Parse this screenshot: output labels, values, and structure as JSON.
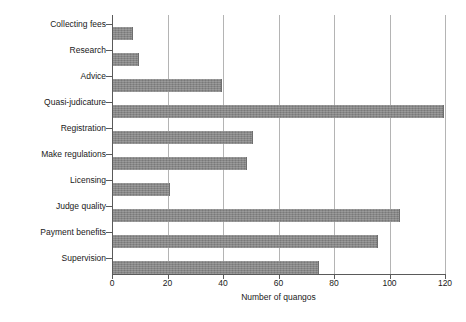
{
  "chart_data": {
    "type": "bar",
    "orientation": "horizontal",
    "title": "",
    "xlabel": "Number of quangos",
    "ylabel": "",
    "xlim": [
      0,
      120
    ],
    "xticks": [
      0,
      20,
      40,
      60,
      80,
      100,
      120
    ],
    "xtick_labels": [
      "0",
      "20",
      "40",
      "60",
      "80",
      "100",
      "120"
    ],
    "grid": "vertical",
    "legend": "none",
    "bar_color": "#878787",
    "axis_color": "#5a5a5a",
    "gridline_color": "#b4b4b4",
    "categories": [
      "Collecting fees",
      "Research",
      "Advice",
      "Quasi-judicature",
      "Registration",
      "Make regulations",
      "Licensing",
      "Judge quality",
      "Payment benefits",
      "Supervision"
    ],
    "values": [
      7,
      9,
      39,
      119,
      50,
      48,
      20,
      103,
      95,
      74
    ]
  }
}
